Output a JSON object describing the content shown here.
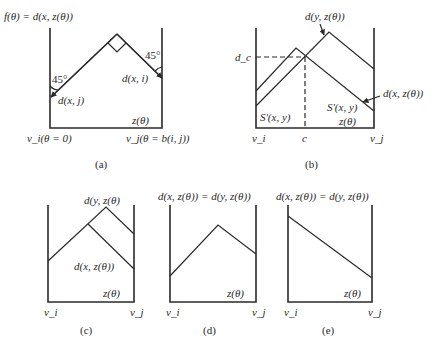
{
  "panels": {
    "a": {
      "caption": "(a)",
      "title": "f(θ) = d(x, z(θ))",
      "angle_left": "45°",
      "angle_right": "45°",
      "label_left_end": "d(x, j)",
      "label_right_end": "d(x, i)",
      "label_axis": "z(θ)",
      "label_vi": "v_i(θ = 0)",
      "label_vj": "v_j(θ = b(i, j))"
    },
    "b": {
      "caption": "(b)",
      "label_dy": "d(y, z(θ))",
      "label_dx": "d(x, z(θ))",
      "label_dc": "d_c",
      "label_c": "c",
      "label_s_left": "S'(x, y)",
      "label_s_right": "S'(x, y)",
      "label_axis": "z(θ)",
      "label_vi": "v_i",
      "label_vj": "v_j"
    },
    "c": {
      "caption": "(c)",
      "label_dy": "d(y, z(θ)",
      "label_dx": "d(x, z(θ))",
      "label_axis": "z(θ)",
      "label_vi": "v_i",
      "label_vj": "v_j"
    },
    "d": {
      "caption": "(d)",
      "title": "d(x, z(θ)) = d(y, z(θ))",
      "label_axis": "z(θ)",
      "label_vi": "v_i",
      "label_vj": "v_j"
    },
    "e": {
      "caption": "(e)",
      "title": "d(x, z(θ)) = d(y, z(θ))",
      "label_axis": "z(θ)",
      "label_vi": "v_i",
      "label_vj": "v_j"
    }
  }
}
